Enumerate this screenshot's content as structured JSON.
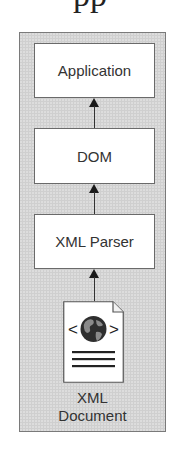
{
  "diagram": {
    "top_fragment": "pp",
    "nodes": [
      {
        "id": "application",
        "label": "Application"
      },
      {
        "id": "dom",
        "label": "DOM"
      },
      {
        "id": "xml-parser",
        "label": "XML Parser"
      }
    ],
    "document": {
      "label_line1": "XML",
      "label_line2": "Document",
      "icon": "xml-document-globe-icon",
      "bracket_left": "<",
      "bracket_right": ">"
    },
    "edges": [
      {
        "from": "xml-document",
        "to": "xml-parser"
      },
      {
        "from": "xml-parser",
        "to": "dom"
      },
      {
        "from": "dom",
        "to": "application"
      }
    ],
    "colors": {
      "frame_fill": "#cfcfcf",
      "frame_border": "#7a7a7a",
      "box_fill": "#ffffff",
      "box_border": "#6a6a6a",
      "arrow": "#1a1a1a",
      "text": "#333333"
    }
  }
}
